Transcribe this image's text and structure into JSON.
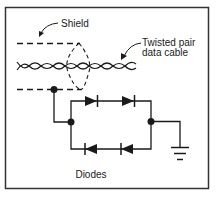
{
  "diagram": {
    "labels": {
      "shield": "Shield",
      "cable_line1": "Twisted pair",
      "cable_line2": "data cable",
      "diodes": "Diodes"
    },
    "components": {
      "shield": "dashed shield conductors with drain wire",
      "cable": "twisted pair data cable",
      "diode_bridge": "four diodes: two forward (top row), two reverse (bottom row)",
      "ground": "ground symbol"
    },
    "colors": {
      "line": "#1a1a1a",
      "background": "#ffffff",
      "border": "#333333"
    }
  }
}
